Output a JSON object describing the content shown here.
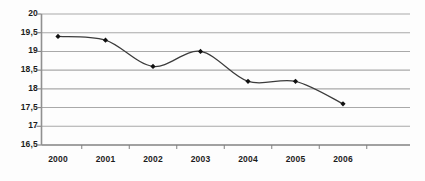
{
  "chart_data": {
    "type": "line",
    "title": "",
    "subtitle": "",
    "xlabel": "",
    "ylabel": "",
    "categories": [
      "2000",
      "2001",
      "2002",
      "2003",
      "2004",
      "2005",
      "2006"
    ],
    "x": [
      2000,
      2001,
      2002,
      2003,
      2004,
      2005,
      2006
    ],
    "values": [
      19.4,
      19.3,
      18.6,
      19.0,
      18.2,
      18.2,
      17.6
    ],
    "series": [
      {
        "name": "",
        "values": [
          19.4,
          19.3,
          18.6,
          19.0,
          18.2,
          18.2,
          17.6
        ]
      }
    ],
    "ylim": [
      16.5,
      20.0
    ],
    "ytick_values": [
      20.0,
      19.5,
      19.0,
      18.5,
      18.0,
      17.5,
      17.0,
      16.5
    ],
    "ytick_labels": [
      "20",
      "19,5",
      "19",
      "18,5",
      "18",
      "17,5",
      "17",
      "16,5"
    ],
    "xtick_labels": [
      "2000",
      "2001",
      "2002",
      "2003",
      "2004",
      "2005",
      "2006"
    ],
    "grid": true,
    "grid_axis": "y",
    "legend": false,
    "legend_position": "none",
    "smoothing": "spline",
    "marker": "diamond",
    "annotations": [],
    "colors": {
      "line": "#3b3b3b",
      "marker": "#111111",
      "grid": "#a9a9a9",
      "axis": "#808080",
      "background": "#fdfdfd",
      "tick_text": "#1c1c1c"
    }
  }
}
